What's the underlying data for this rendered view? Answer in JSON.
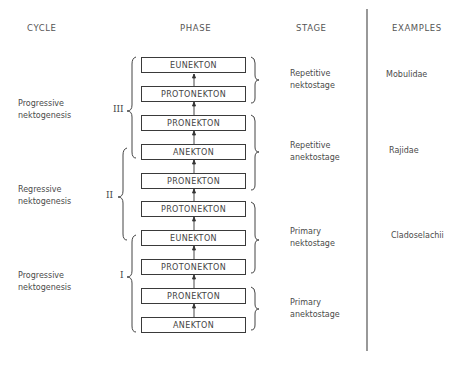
{
  "headers": {
    "cycle": "CYCLE",
    "phase": "PHASE",
    "stage": "STAGE",
    "examples": "EXAMPLES"
  },
  "phases": [
    {
      "label": "EUNEKTON",
      "top": 57
    },
    {
      "label": "PROTONEKTON",
      "top": 86
    },
    {
      "label": "PRONEKTON",
      "top": 115
    },
    {
      "label": "ANEKTON",
      "top": 144
    },
    {
      "label": "PRONEKTON",
      "top": 173
    },
    {
      "label": "PROTONEKTON",
      "top": 201
    },
    {
      "label": "EUNEKTON",
      "top": 230
    },
    {
      "label": "PROTONEKTON",
      "top": 259
    },
    {
      "label": "PRONEKTON",
      "top": 288
    },
    {
      "label": "ANEKTON",
      "top": 317
    }
  ],
  "cycles": [
    {
      "numeral": "III",
      "line1": "Progressive",
      "line2": "nektogenesis"
    },
    {
      "numeral": "II",
      "line1": "Regressive",
      "line2": "nektogenesis"
    },
    {
      "numeral": "I",
      "line1": "Progressive",
      "line2": "nektogenesis"
    }
  ],
  "stages": [
    {
      "line1": "Repetitive",
      "line2": "nektostage"
    },
    {
      "line1": "Repetitive",
      "line2": "anektostage"
    },
    {
      "line1": "Primary",
      "line2": "nektostage"
    },
    {
      "line1": "Primary",
      "line2": "anektostage"
    }
  ],
  "examples": [
    "Mobulidae",
    "Rajidae",
    "Cladoselachii"
  ]
}
